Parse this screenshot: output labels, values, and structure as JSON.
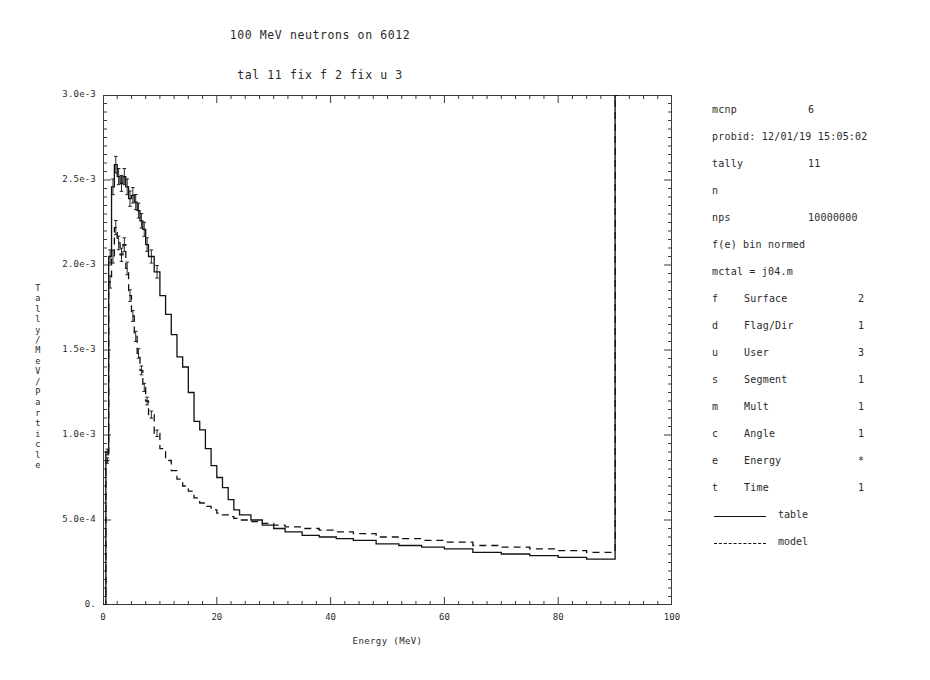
{
  "titles": {
    "main": "100 MeV neutrons on 6012",
    "sub": "tal 11 fix f 2 fix u 3"
  },
  "info": {
    "code_label": "mcnp",
    "code_version": "6",
    "probid": "probid: 12/01/19 15:05:02",
    "tally_label": "tally",
    "tally_value": "11",
    "particle": "n",
    "nps_label": "nps",
    "nps_value": "10000000",
    "norm": "f(e) bin normed",
    "mctal": "mctal = j04.m"
  },
  "bins": [
    {
      "code": "f",
      "name": "Surface",
      "value": "2"
    },
    {
      "code": "d",
      "name": "Flag/Dir",
      "value": "1"
    },
    {
      "code": "u",
      "name": "User",
      "value": "3"
    },
    {
      "code": "s",
      "name": "Segment",
      "value": "1"
    },
    {
      "code": "m",
      "name": "Mult",
      "value": "1"
    },
    {
      "code": "c",
      "name": "Angle",
      "value": "1"
    },
    {
      "code": "e",
      "name": "Energy",
      "value": "*"
    },
    {
      "code": "t",
      "name": "Time",
      "value": "1"
    }
  ],
  "legend": [
    {
      "label": "table",
      "style": "solid"
    },
    {
      "label": "model",
      "style": "dashed"
    }
  ],
  "axes": {
    "ylabel_chars": [
      "T",
      "a",
      "l",
      "l",
      "y",
      "/",
      "M",
      "e",
      "V",
      "/",
      "P",
      "a",
      "r",
      "t",
      "i",
      "c",
      "l",
      "e"
    ],
    "xlabel": "Energy (MeV)",
    "ytick_labels": [
      "0.",
      "5.0e-4",
      "1.0e-3",
      "1.5e-3",
      "2.0e-3",
      "2.5e-3",
      "3.0e-3"
    ],
    "ytick_values": [
      0,
      0.0005,
      0.001,
      0.0015,
      0.002,
      0.0025,
      0.003
    ],
    "xtick_labels": [
      "0",
      "20",
      "40",
      "60",
      "80",
      "100"
    ],
    "xtick_values": [
      0,
      20,
      40,
      60,
      80,
      100
    ]
  },
  "chart_data": {
    "type": "line",
    "title": "100 MeV neutrons on 6012",
    "subtitle": "tal 11 fix f 2 fix u 3",
    "xlabel": "Energy (MeV)",
    "ylabel": "Tally/MeV/Particle",
    "xlim": [
      0,
      100
    ],
    "ylim": [
      0,
      0.003
    ],
    "grid": false,
    "legend_position": "right",
    "drawstyle": "steps-post",
    "series": [
      {
        "name": "table",
        "style": "solid",
        "x": [
          0.0,
          0.5,
          1.0,
          1.5,
          2.0,
          2.5,
          3.0,
          3.5,
          4.0,
          4.5,
          5.0,
          5.5,
          6.0,
          6.5,
          7.0,
          7.5,
          8.0,
          9.0,
          10.0,
          11.0,
          12.0,
          13.0,
          14.0,
          15.0,
          16.0,
          17.0,
          18.0,
          19.0,
          20.0,
          21.0,
          22.0,
          23.0,
          24.0,
          26.0,
          28.0,
          30.0,
          32.0,
          35.0,
          38.0,
          41.0,
          44.0,
          48.0,
          52.0,
          56.0,
          60.0,
          65.0,
          70.0,
          75.0,
          80.0,
          85.0,
          89.0,
          90.0,
          90.5
        ],
        "y": [
          0.0,
          0.0009,
          0.00205,
          0.00246,
          0.00259,
          0.00252,
          0.00248,
          0.00252,
          0.00246,
          0.00239,
          0.00241,
          0.00237,
          0.00232,
          0.00226,
          0.00221,
          0.00212,
          0.00205,
          0.00196,
          0.00182,
          0.00171,
          0.00159,
          0.00146,
          0.0014,
          0.00125,
          0.00108,
          0.00103,
          0.00092,
          0.00082,
          0.00075,
          0.00069,
          0.00062,
          0.00056,
          0.00053,
          0.0005,
          0.00047,
          0.00045,
          0.00043,
          0.00041,
          0.0004,
          0.00039,
          0.00038,
          0.00036,
          0.00035,
          0.00034,
          0.00033,
          0.00031,
          0.0003,
          0.00029,
          0.00028,
          0.00027,
          0.00027,
          0.003,
          0.003
        ]
      },
      {
        "name": "model",
        "style": "dashed",
        "x": [
          0.0,
          0.5,
          1.0,
          1.5,
          2.0,
          2.5,
          3.0,
          3.5,
          4.0,
          4.5,
          5.0,
          5.5,
          6.0,
          6.5,
          7.0,
          7.5,
          8.0,
          9.0,
          10.0,
          11.0,
          12.0,
          13.0,
          14.0,
          15.0,
          16.0,
          17.0,
          18.0,
          19.0,
          20.0,
          21.0,
          22.0,
          23.0,
          24.0,
          26.0,
          28.0,
          30.0,
          32.0,
          35.0,
          38.0,
          41.0,
          44.0,
          48.0,
          52.0,
          56.0,
          60.0,
          65.0,
          70.0,
          75.0,
          80.0,
          85.0,
          89.0,
          90.0,
          90.5
        ],
        "y": [
          0.0,
          0.00085,
          0.0019,
          0.00205,
          0.00222,
          0.00213,
          0.00206,
          0.00212,
          0.00198,
          0.00182,
          0.0017,
          0.00158,
          0.00148,
          0.00138,
          0.00128,
          0.0012,
          0.00112,
          0.00101,
          0.00092,
          0.00085,
          0.00079,
          0.00074,
          0.0007,
          0.00067,
          0.00063,
          0.0006,
          0.00058,
          0.00056,
          0.00054,
          0.00053,
          0.00052,
          0.00051,
          0.0005,
          0.00049,
          0.00048,
          0.00047,
          0.00046,
          0.00045,
          0.00044,
          0.00043,
          0.00042,
          0.0004,
          0.00039,
          0.00038,
          0.00037,
          0.00035,
          0.00034,
          0.00033,
          0.00032,
          0.00031,
          0.00031,
          0.003,
          0.003
        ]
      }
    ]
  }
}
